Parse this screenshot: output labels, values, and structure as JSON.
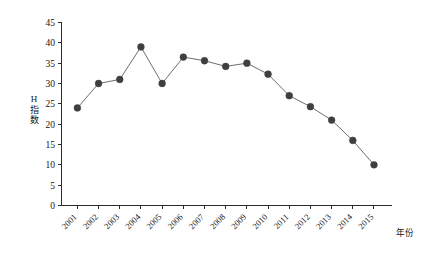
{
  "chart_data": {
    "type": "line",
    "title": "",
    "subtitle": "",
    "xlabel": "年份",
    "ylabel": "H指数",
    "ylabel_chars": [
      "H",
      "指",
      "数"
    ],
    "categories": [
      "2001",
      "2002",
      "2003",
      "2004",
      "2005",
      "2006",
      "2007",
      "2008",
      "2009",
      "2010",
      "2011",
      "2012",
      "2013",
      "2014",
      "2015"
    ],
    "values": [
      24,
      30,
      31,
      39,
      30,
      36.5,
      35.6,
      34.2,
      35,
      32.3,
      27,
      24.3,
      21,
      16,
      10
    ],
    "series": [
      {
        "name": "H指数",
        "values": [
          24,
          30,
          31,
          39,
          30,
          36.5,
          35.6,
          34.2,
          35,
          32.3,
          27,
          24.3,
          21,
          16,
          10
        ]
      }
    ],
    "ylim": [
      0,
      45
    ],
    "yticks": [
      0,
      5,
      10,
      15,
      20,
      25,
      30,
      35,
      40,
      45
    ],
    "ytick_labels": [
      "0",
      "5",
      "10",
      "15",
      "20",
      "25",
      "30",
      "35",
      "40",
      "45"
    ],
    "xtick_labels": [
      "2001",
      "2002",
      "2003",
      "2004",
      "2005",
      "2006",
      "2007",
      "2008",
      "2009",
      "2010",
      "2011",
      "2012",
      "2013",
      "2014",
      "2015"
    ],
    "xtick_rotation": -45,
    "grid": false,
    "legend": false,
    "legend_position": "none",
    "marker": "circle",
    "colors": {
      "line": "#6e6e6e",
      "marker": "#3f3f3f",
      "axis": "#2b2b2b",
      "text": "#161616",
      "background": "#ffffff"
    }
  }
}
